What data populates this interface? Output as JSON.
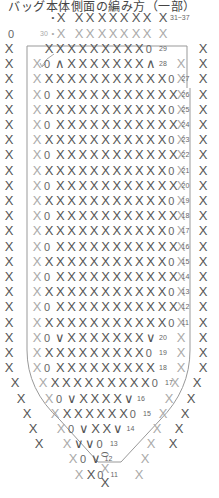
{
  "title": "バッグ本体側面の編み方（一部）",
  "chart_data": {
    "type": "table",
    "title": "バッグ本体側面の編み方（一部）",
    "legend": {
      "X": "single crochet (こま編み)",
      "0": "chain stitch (くさり編み)",
      "∧": "decrease (2目一度)",
      "∨": "increase (2目編み入れる)"
    },
    "top_label": "31~37",
    "round_30_label": "30",
    "rows": [
      {
        "round": "29",
        "pattern": "X XXXXXXX X 0"
      },
      {
        "round": "28",
        "pattern": "0 ∧ XXXXXXX ∧"
      },
      {
        "round": "27",
        "pattern": "XXXXXXXXXXX0"
      },
      {
        "round": "26",
        "pattern": "0XXXXXXXXXXX"
      },
      {
        "round": "25",
        "pattern": "XXXXXXXXXXX0"
      },
      {
        "round": "24",
        "pattern": "0XXXXXXXXXXX"
      },
      {
        "round": "23",
        "pattern": "XXXXXXXXXXX0"
      },
      {
        "round": "22",
        "pattern": "0XXXXXXXXXXX"
      },
      {
        "round": "21",
        "pattern": "XXXXXXXXXXX0"
      },
      {
        "round": "20",
        "pattern": "0XXXXXXXXXXX"
      },
      {
        "round": "19",
        "pattern": "XXXXXXXXXXX0"
      },
      {
        "round": "18",
        "pattern": "0XXXXXXXXXXX"
      },
      {
        "round": "17",
        "pattern": "XXXXXXXXXXX0"
      },
      {
        "round": "16",
        "pattern": "0XXXXXXXXXXX"
      },
      {
        "round": "15",
        "pattern": "XXXXXXXXXXX0"
      },
      {
        "round": "14",
        "pattern": "0XXXXXXXXXXX"
      },
      {
        "round": "13",
        "pattern": "XXXXXXXXXXX0"
      },
      {
        "round": "12",
        "pattern": "0XXXXXXXXXXX"
      },
      {
        "round": "11",
        "pattern": "XXXXXXXXXXX0"
      },
      {
        "round": "20",
        "pattern": "0 ∨ XXXXXXX ∨"
      },
      {
        "round": "19",
        "pattern": "X XXXXXXX X 0"
      },
      {
        "round": "18",
        "pattern": "0 X XXXXXXX X"
      },
      {
        "round": "17",
        "pattern": "X XXXXXXX X 0"
      },
      {
        "round": "16",
        "pattern": "0 ∨ XXXX ∨"
      },
      {
        "round": "15",
        "pattern": "X XXXX X 0"
      },
      {
        "round": "14",
        "pattern": "0 ∨ XX ∨"
      },
      {
        "round": "13",
        "pattern": "∨ ∨ 0"
      },
      {
        "round": "12",
        "pattern": "0 ∨"
      },
      {
        "round": "11",
        "pattern": "X 0"
      }
    ],
    "bottom": [
      "foundation chain (oval)",
      "X",
      "X"
    ]
  },
  "labels": {
    "top_label": "31~37",
    "r30": "30",
    "left_chain": "0",
    "rounds_upper": [
      "29",
      "28",
      "27",
      "26",
      "25",
      "24",
      "23",
      "22",
      "21",
      "20",
      "19",
      "18",
      "17",
      "16",
      "15",
      "14",
      "13",
      "12",
      "11"
    ],
    "rounds_lower": [
      "20",
      "19",
      "18",
      "17",
      "16",
      "15",
      "14",
      "13",
      "12",
      "11"
    ]
  },
  "symbols": {
    "sc": "X",
    "ch": "0",
    "dec": "∧",
    "inc": "∨"
  },
  "colors": {
    "dark": "#555555",
    "light": "#aaaaaa",
    "line": "#999999"
  }
}
